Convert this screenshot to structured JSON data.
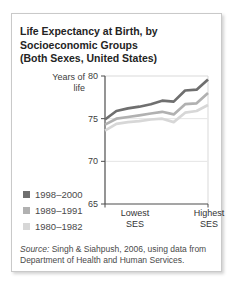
{
  "header": {
    "title_lines": [
      "Life Expectancy at Birth, by",
      "Socioeconomic Groups",
      "(Both Sexes, United States)"
    ]
  },
  "chart_data": {
    "type": "line",
    "title": "Life Expectancy at Birth, by Socioeconomic Groups (Both Sexes, United States)",
    "ylabel": "Years of life",
    "ylim": [
      65,
      80
    ],
    "yticks": [
      80,
      75,
      70,
      65
    ],
    "grid_values": [
      75,
      70
    ],
    "xtick_labels": [
      "Lowest SES",
      "Highest SES"
    ],
    "x_categories": [
      "Lowest SES",
      "2",
      "3",
      "4",
      "5",
      "6",
      "7",
      "8",
      "9",
      "Highest SES"
    ],
    "legend_position": "left of plot, bottom",
    "grid_on": true,
    "axis_color": "#4d4d4d",
    "grid_color": "#e4e4e4",
    "frame_color": "#d9d9d9",
    "series": [
      {
        "name": "1998–2000",
        "color": "#6f6f6f",
        "values": [
          74.9,
          75.9,
          76.2,
          76.4,
          76.7,
          77.1,
          77.0,
          78.3,
          78.4,
          79.6
        ]
      },
      {
        "name": "1989–1991",
        "color": "#b1b1b1",
        "values": [
          74.3,
          75.0,
          75.2,
          75.4,
          75.6,
          75.8,
          75.5,
          76.7,
          76.8,
          78.0
        ]
      },
      {
        "name": "1980–1982",
        "color": "#d7d7d7",
        "values": [
          73.6,
          74.4,
          74.6,
          74.7,
          74.9,
          75.0,
          74.6,
          75.7,
          75.9,
          76.6
        ]
      }
    ]
  },
  "source": {
    "label": "Source:",
    "text": "Singh & Siahpush, 2006, using data from Department of Health and Human Services."
  }
}
